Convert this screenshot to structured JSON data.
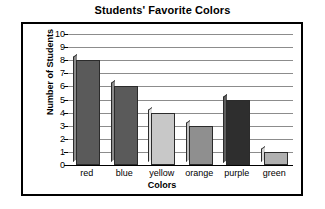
{
  "chart_data": {
    "type": "bar",
    "title": "Students' Favorite Colors",
    "xlabel": "Colors",
    "ylabel": "Number of Students",
    "categories": [
      "red",
      "blue",
      "yellow",
      "orange",
      "purple",
      "green"
    ],
    "values": [
      8,
      6,
      4,
      3,
      5,
      1
    ],
    "ylim": [
      0,
      10
    ],
    "ytick_labels": [
      "0",
      "1",
      "2",
      "3",
      "4",
      "5",
      "6",
      "7",
      "8",
      "9",
      "10"
    ],
    "ytick_values": [
      0,
      1,
      2,
      3,
      4,
      5,
      6,
      7,
      8,
      9,
      10
    ],
    "grid": true,
    "legend": false,
    "bar_colors": [
      "#5a5a5a",
      "#5a5a5a",
      "#c8c8c8",
      "#8f8f8f",
      "#2e2e2e",
      "#b0b0b0"
    ],
    "bar_side_colors": [
      "#8a8a8a",
      "#8a8a8a",
      "#e2e2e2",
      "#bdbdbd",
      "#5e5e5e",
      "#d6d6d6"
    ],
    "gridline_color": "#8c8c8c",
    "axis_color": "#000000",
    "frame_color": "#000000",
    "background": "#ffffff"
  }
}
